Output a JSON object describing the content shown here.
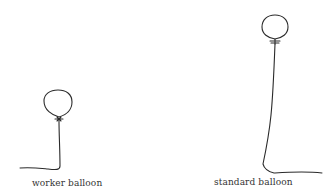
{
  "figure": {
    "balloons": [
      {
        "id": "worker",
        "label": "worker balloon"
      },
      {
        "id": "standard",
        "label": "standard balloon"
      }
    ],
    "stroke_color": "#2a2a2a"
  }
}
